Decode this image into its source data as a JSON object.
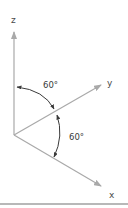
{
  "diagram": {
    "type": "coordinate-axes",
    "axes": {
      "z": {
        "label": "z",
        "direction": "up"
      },
      "y": {
        "label": "y",
        "direction": "up-right"
      },
      "x": {
        "label": "x",
        "direction": "down-right"
      }
    },
    "angles": [
      {
        "between": [
          "z",
          "y"
        ],
        "label": "60°"
      },
      {
        "between": [
          "y",
          "x"
        ],
        "label": "60°"
      }
    ],
    "colors": {
      "axis": "#a9a9a9",
      "arc": "#3a3a3a",
      "text": "#4a4a4a",
      "divider": "#b8b8b8"
    }
  }
}
